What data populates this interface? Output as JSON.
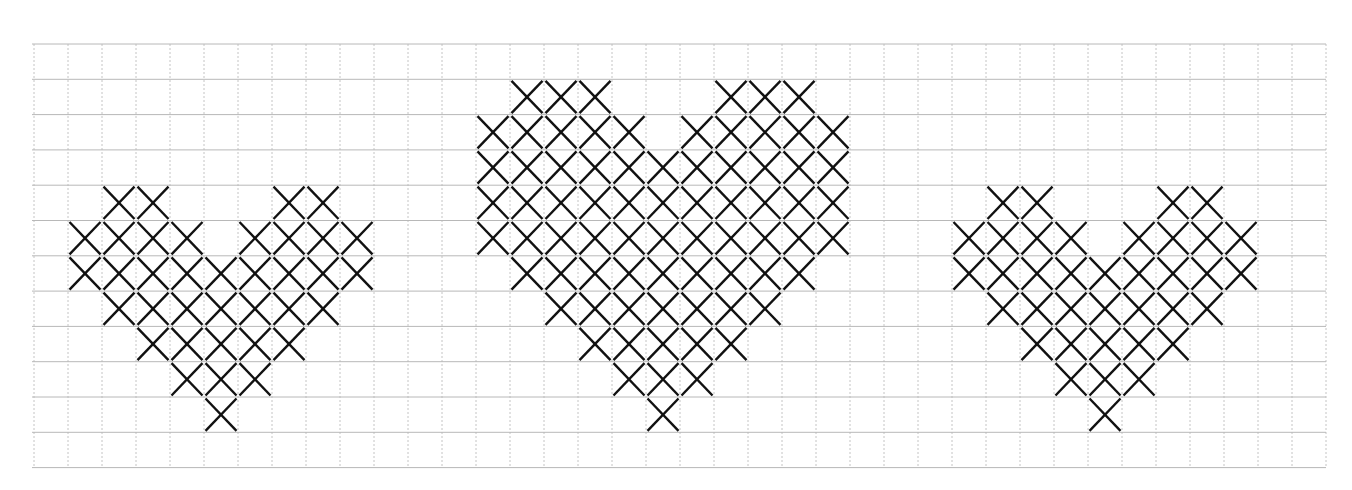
{
  "grid": {
    "origin_x": 34,
    "origin_y": 44,
    "cols": 38,
    "rows": 12,
    "cell_w": 34,
    "cell_h": 35.3,
    "h_line_color": "#b8b8b8",
    "v_line_color": "#c4c4c4",
    "stitch_color": "#111111"
  },
  "patterns": [
    {
      "name": "heart-small-left",
      "rows": [
        {
          "row": 4,
          "cols": [
            2,
            3,
            7,
            8
          ]
        },
        {
          "row": 5,
          "cols": [
            1,
            2,
            3,
            4,
            6,
            7,
            8,
            9
          ]
        },
        {
          "row": 6,
          "cols": [
            1,
            2,
            3,
            4,
            5,
            6,
            7,
            8,
            9
          ]
        },
        {
          "row": 7,
          "cols": [
            2,
            3,
            4,
            5,
            6,
            7,
            8
          ]
        },
        {
          "row": 8,
          "cols": [
            3,
            4,
            5,
            6,
            7
          ]
        },
        {
          "row": 9,
          "cols": [
            4,
            5,
            6
          ]
        },
        {
          "row": 10,
          "cols": [
            5
          ]
        }
      ]
    },
    {
      "name": "heart-large-middle",
      "rows": [
        {
          "row": 1,
          "cols": [
            14,
            15,
            16,
            20,
            21,
            22
          ]
        },
        {
          "row": 2,
          "cols": [
            13,
            14,
            15,
            16,
            17,
            19,
            20,
            21,
            22,
            23
          ]
        },
        {
          "row": 3,
          "cols": [
            13,
            14,
            15,
            16,
            17,
            18,
            19,
            20,
            21,
            22,
            23
          ]
        },
        {
          "row": 4,
          "cols": [
            13,
            14,
            15,
            16,
            17,
            18,
            19,
            20,
            21,
            22,
            23
          ]
        },
        {
          "row": 5,
          "cols": [
            13,
            14,
            15,
            16,
            17,
            18,
            19,
            20,
            21,
            22,
            23
          ]
        },
        {
          "row": 6,
          "cols": [
            14,
            15,
            16,
            17,
            18,
            19,
            20,
            21,
            22
          ]
        },
        {
          "row": 7,
          "cols": [
            15,
            16,
            17,
            18,
            19,
            20,
            21
          ]
        },
        {
          "row": 8,
          "cols": [
            16,
            17,
            18,
            19,
            20
          ]
        },
        {
          "row": 9,
          "cols": [
            17,
            18,
            19
          ]
        },
        {
          "row": 10,
          "cols": [
            18
          ]
        }
      ]
    },
    {
      "name": "heart-small-right",
      "rows": [
        {
          "row": 4,
          "cols": [
            28,
            29,
            33,
            34
          ]
        },
        {
          "row": 5,
          "cols": [
            27,
            28,
            29,
            30,
            32,
            33,
            34,
            35
          ]
        },
        {
          "row": 6,
          "cols": [
            27,
            28,
            29,
            30,
            31,
            32,
            33,
            34,
            35
          ]
        },
        {
          "row": 7,
          "cols": [
            28,
            29,
            30,
            31,
            32,
            33,
            34
          ]
        },
        {
          "row": 8,
          "cols": [
            29,
            30,
            31,
            32,
            33
          ]
        },
        {
          "row": 9,
          "cols": [
            30,
            31,
            32
          ]
        },
        {
          "row": 10,
          "cols": [
            31
          ]
        }
      ]
    }
  ]
}
